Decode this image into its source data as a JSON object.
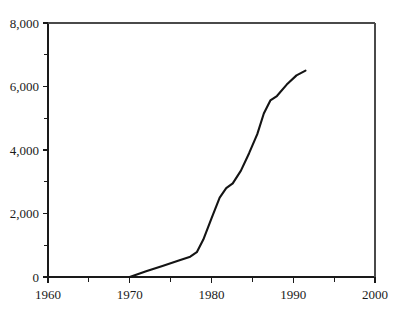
{
  "chart_data": {
    "type": "line",
    "title": "",
    "subtitle": "",
    "xlabel": "",
    "ylabel": "",
    "xlim": [
      1960,
      2000
    ],
    "ylim": [
      0,
      8000
    ],
    "grid": false,
    "legend": null,
    "legend_position": "none",
    "x_ticks": [
      1960,
      1970,
      1980,
      1990,
      2000
    ],
    "x_tick_labels": [
      "1960",
      "1970",
      "1980",
      "1990",
      "2000"
    ],
    "x_minor_ticks": [
      1965,
      1975,
      1985,
      1995
    ],
    "y_ticks": [
      0,
      2000,
      4000,
      6000,
      8000
    ],
    "y_tick_labels": [
      "0",
      "2,000",
      "4,000",
      "6,000",
      "8,000"
    ],
    "y_minor_ticks": [
      1000,
      3000,
      5000,
      7000
    ],
    "series": [
      {
        "name": "series-1",
        "color": "#141414",
        "x": [
          1970.0,
          1972.0,
          1974.0,
          1976.0,
          1977.4,
          1978.2,
          1979.0,
          1980.0,
          1981.0,
          1981.8,
          1982.6,
          1983.6,
          1984.6,
          1985.6,
          1986.4,
          1987.2,
          1988.0,
          1989.2,
          1990.4,
          1991.5
        ],
        "y": [
          0,
          180,
          350,
          520,
          640,
          780,
          1180,
          1850,
          2500,
          2800,
          2950,
          3350,
          3900,
          4500,
          5150,
          5560,
          5700,
          6060,
          6350,
          6500
        ]
      }
    ],
    "axis_colors": {
      "axis": "#1a1a1a",
      "frame": "#4a4a4a",
      "line": "#141414",
      "text": "#1a1a1a",
      "background": "#ffffff"
    },
    "plot_box": {
      "left": 48,
      "right": 375,
      "top": 23,
      "bottom": 277
    }
  }
}
